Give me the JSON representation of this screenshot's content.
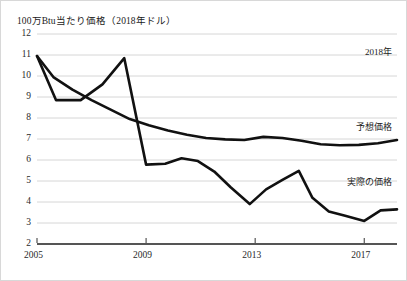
{
  "figure": {
    "axis_title": "100万Btu当たり価格（2018年ドル）",
    "border_color": "#d8d8d8",
    "gridline_color": "#cccccc",
    "line_color": "#111111",
    "background": "#ffffff"
  },
  "annotations": {
    "year_note": "2018年",
    "forecast_label": "予想価格",
    "actual_label": "実際の価格"
  },
  "chart_data": {
    "type": "line",
    "title": "",
    "subtitle": "",
    "xlabel": "",
    "ylabel": "100万Btu当たり価格（2018年ドル）",
    "xlim": [
      2005,
      2018.2
    ],
    "ylim": [
      2,
      12
    ],
    "ytick_labels": [
      "12",
      "11",
      "10",
      "9",
      "8",
      "7",
      "6",
      "5",
      "4",
      "3",
      "2"
    ],
    "ytick_values": [
      12,
      11,
      10,
      9,
      8,
      7,
      6,
      5,
      4,
      3,
      2
    ],
    "xtick_labels": [
      "2005",
      "2009",
      "2013",
      "2017"
    ],
    "xtick_values": [
      2005,
      2009,
      2013,
      2017
    ],
    "grid": true,
    "grid_axis": "y",
    "legend": "inline-annotations",
    "legend_position": "right",
    "series": [
      {
        "name": "予想価格",
        "label_text": "予想価格",
        "x": [
          2005.0,
          2005.6,
          2006.3,
          2007.0,
          2007.7,
          2008.4,
          2009.1,
          2009.8,
          2010.5,
          2011.2,
          2011.9,
          2012.6,
          2013.3,
          2014.0,
          2014.7,
          2015.4,
          2016.1,
          2016.8,
          2017.5,
          2018.2
        ],
        "values": [
          10.95,
          9.95,
          9.35,
          8.85,
          8.4,
          7.95,
          7.65,
          7.4,
          7.2,
          7.05,
          6.98,
          6.95,
          7.1,
          7.05,
          6.92,
          6.75,
          6.7,
          6.72,
          6.8,
          6.95
        ]
      },
      {
        "name": "実際の価格",
        "label_text": "実際の価格",
        "x": [
          2005.0,
          2005.7,
          2006.6,
          2007.4,
          2008.2,
          2009.0,
          2009.7,
          2010.3,
          2010.9,
          2011.5,
          2012.1,
          2012.8,
          2013.4,
          2014.0,
          2014.6,
          2015.1,
          2015.7,
          2016.3,
          2017.0,
          2017.6,
          2018.2
        ],
        "values": [
          10.95,
          8.85,
          8.85,
          9.6,
          10.85,
          5.78,
          5.82,
          6.08,
          5.95,
          5.45,
          4.7,
          3.9,
          4.6,
          5.05,
          5.48,
          4.2,
          3.55,
          3.35,
          3.1,
          3.6,
          3.65
        ]
      }
    ]
  }
}
